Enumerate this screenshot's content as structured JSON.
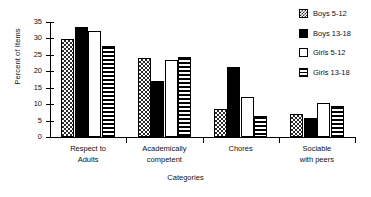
{
  "chart_data": {
    "type": "bar",
    "title": "",
    "xlabel": "Categories",
    "ylabel": "Percent of Items",
    "ylim": [
      0,
      35
    ],
    "yticks": [
      0,
      5,
      10,
      15,
      20,
      25,
      30,
      35
    ],
    "grid": false,
    "legend_position": "right",
    "categories": [
      "Respect to\nAdults",
      "Academically\ncompetent",
      "Chores",
      "Sociable\nwith peers"
    ],
    "category_lines": [
      [
        "Respect to",
        "Adults"
      ],
      [
        "Academically",
        "competent"
      ],
      [
        "Chores",
        ""
      ],
      [
        "Sociable",
        "with peers"
      ]
    ],
    "series": [
      {
        "name": "Boys 5-12",
        "pattern": "checkered",
        "values": [
          29.7,
          23.9,
          8.5,
          7.1
        ]
      },
      {
        "name": "Boys 13-18",
        "pattern": "solid-black",
        "values": [
          33.6,
          17.0,
          21.2,
          5.7
        ]
      },
      {
        "name": "Girls 5-12",
        "pattern": "white-empty",
        "values": [
          32.3,
          23.5,
          12.1,
          10.3
        ]
      },
      {
        "name": "Girls 13-18",
        "pattern": "horizontal-lines",
        "values": [
          27.8,
          24.5,
          6.4,
          9.3
        ]
      }
    ]
  },
  "axes": {
    "y_title": "Percent of Items",
    "x_title": "Categories",
    "y_tick_labels": [
      "0",
      "5",
      "10",
      "15",
      "20",
      "25",
      "30",
      "35"
    ]
  },
  "legend": {
    "items": [
      {
        "label": "Boys 5-12"
      },
      {
        "label": "Boys 13-18"
      },
      {
        "label": "Girls 5-12"
      },
      {
        "label": "Girls 13-18"
      }
    ]
  },
  "colors": {
    "ink": "#000000",
    "background": "#ffffff"
  }
}
